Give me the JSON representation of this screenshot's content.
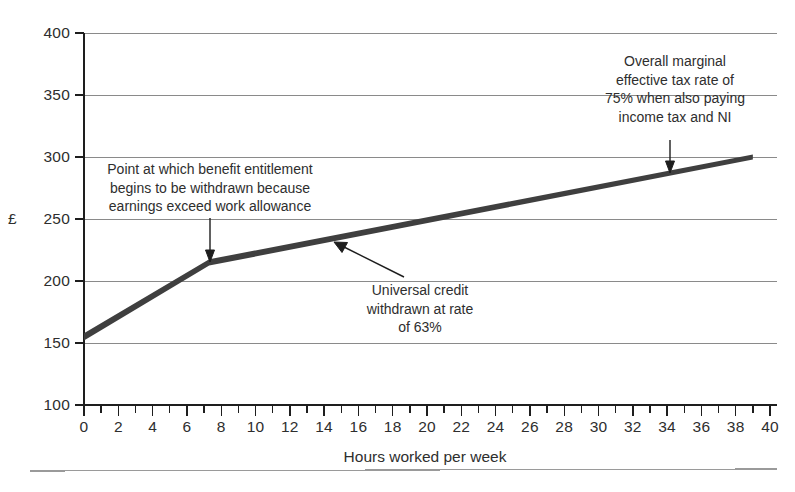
{
  "chart_data": {
    "type": "line",
    "title": "",
    "xlabel": "Hours worked per week",
    "ylabel": "£",
    "xlim": [
      0,
      40
    ],
    "ylim": [
      100,
      400
    ],
    "xticks": [
      0,
      2,
      4,
      6,
      8,
      10,
      12,
      14,
      16,
      18,
      20,
      22,
      24,
      26,
      28,
      30,
      32,
      34,
      36,
      38,
      40
    ],
    "yticks": [
      100,
      150,
      200,
      250,
      300,
      350,
      400
    ],
    "grid": "horizontal",
    "legend": "none",
    "series": [
      {
        "name": "Net income",
        "x": [
          0,
          7.3,
          39
        ],
        "values": [
          155,
          215,
          300
        ]
      }
    ],
    "annotations": [
      {
        "id": "work-allowance",
        "lines": [
          "Point at which benefit entitlement",
          "begins to be withdrawn because",
          "earnings exceed work allowance"
        ],
        "points_to": {
          "x": 7.3,
          "y": 215
        }
      },
      {
        "id": "uc-taper",
        "lines": [
          "Universal credit",
          "withdrawn at rate",
          "of 63%"
        ],
        "points_to": {
          "x": 14.6,
          "y": 232
        }
      },
      {
        "id": "metr-75",
        "lines": [
          "Overall marginal",
          "effective tax rate of",
          "75% when also paying",
          "income tax and NI"
        ],
        "points_to": {
          "x": 34.2,
          "y": 292
        }
      }
    ]
  },
  "axes": {
    "y_unit_label": "£",
    "y_tick_labels": [
      "400",
      "350",
      "300",
      "250",
      "200",
      "150",
      "100"
    ],
    "x_tick_labels": [
      "0",
      "2",
      "4",
      "6",
      "8",
      "10",
      "12",
      "14",
      "16",
      "18",
      "20",
      "22",
      "24",
      "26",
      "28",
      "30",
      "32",
      "34",
      "36",
      "38",
      "40"
    ],
    "x_axis_title": "Hours worked per week"
  },
  "annotations": {
    "left": {
      "line1": "Point at which benefit entitlement",
      "line2": "begins to be withdrawn because",
      "line3": "earnings exceed work allowance"
    },
    "middle": {
      "line1": "Universal credit",
      "line2": "withdrawn at rate",
      "line3": "of 63%"
    },
    "right": {
      "line1": "Overall marginal",
      "line2": "effective tax rate of",
      "line3": "75% when also paying",
      "line4": "income tax and NI"
    }
  },
  "colors": {
    "series": "#3f3f3f",
    "grid": "#8a8a8a",
    "axis": "#1e1e1e",
    "text": "#2e2e2e",
    "background": "#ffffff"
  }
}
